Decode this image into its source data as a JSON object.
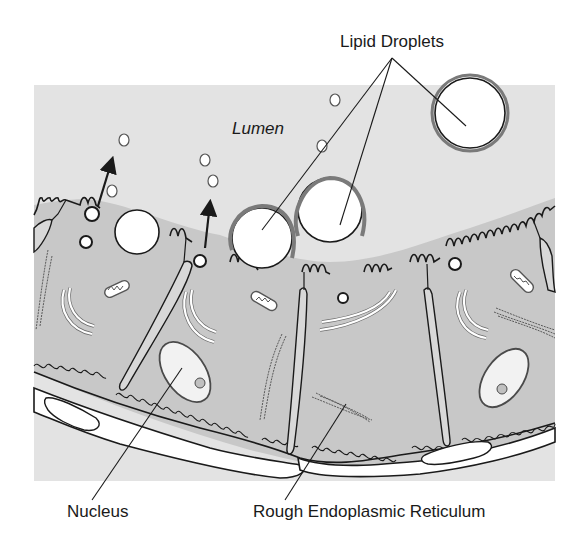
{
  "figure": {
    "type": "biological-cross-section",
    "colors": {
      "lumen": "#e3e3e3",
      "cytoplasm": "#c8c8c8",
      "outline": "#1a1a1a",
      "droplet_fill": "#ffffff",
      "droplet_ring": "#7a7a7a"
    }
  },
  "labels": {
    "lipid_droplets": "Lipid Droplets",
    "lumen": "Lumen",
    "nucleus": "Nucleus",
    "rough_er": "Rough Endoplasmic Reticulum"
  }
}
